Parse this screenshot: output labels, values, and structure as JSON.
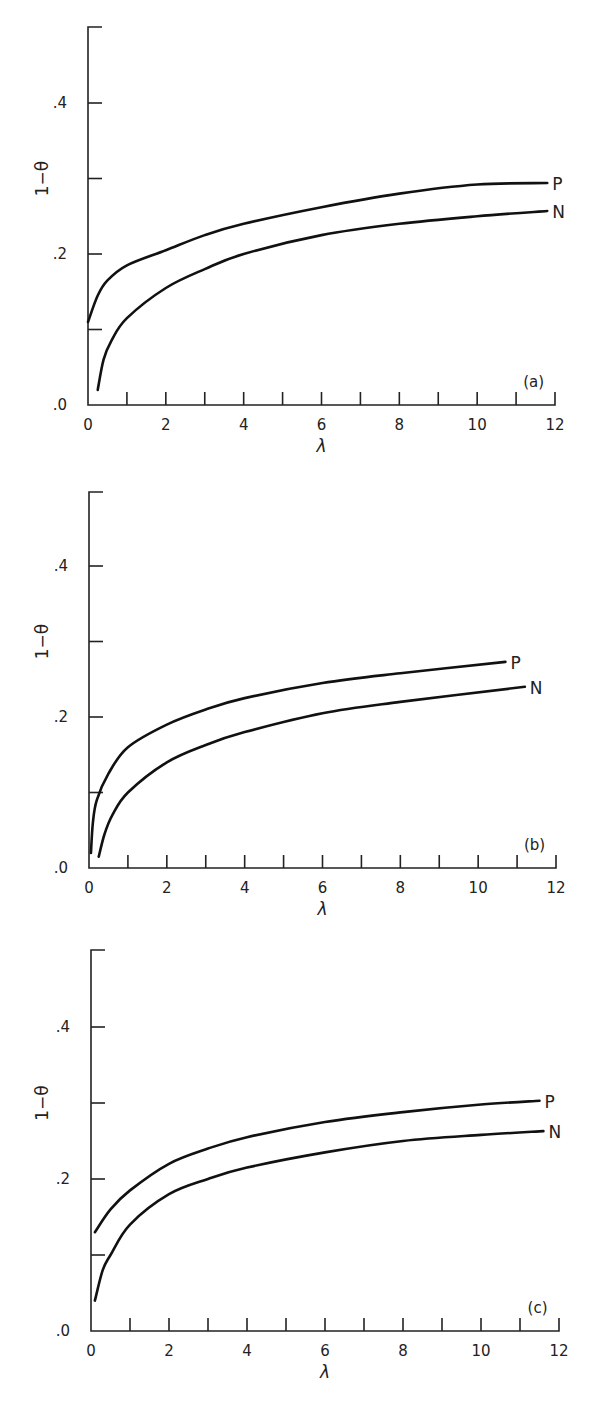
{
  "chart_data": [
    {
      "type": "line",
      "panel_label": "(a)",
      "xlabel": "λ",
      "ylabel": "1−θ",
      "xlim": [
        0,
        12
      ],
      "ylim": [
        0,
        0.5
      ],
      "xticks": [
        0,
        2,
        4,
        6,
        8,
        10,
        12
      ],
      "xtick_labels": [
        "0",
        "2",
        "4",
        "6",
        "8",
        "10",
        "12"
      ],
      "yticks": [
        0,
        0.1,
        0.2,
        0.3,
        0.4
      ],
      "ytick_labels": [
        ".0",
        "",
        ".2",
        "",
        ".4"
      ],
      "grid": false,
      "series": [
        {
          "name": "P",
          "x": [
            0,
            0.25,
            0.5,
            1,
            2,
            3,
            4,
            6,
            8,
            10,
            11.8
          ],
          "y": [
            0.11,
            0.145,
            0.165,
            0.185,
            0.205,
            0.225,
            0.24,
            0.262,
            0.28,
            0.292,
            0.294
          ]
        },
        {
          "name": "N",
          "x": [
            0.25,
            0.4,
            0.6,
            1,
            2,
            3,
            4,
            6,
            8,
            10,
            11.8
          ],
          "y": [
            0.02,
            0.06,
            0.085,
            0.115,
            0.155,
            0.18,
            0.2,
            0.225,
            0.24,
            0.25,
            0.257
          ]
        }
      ]
    },
    {
      "type": "line",
      "panel_label": "(b)",
      "xlabel": "λ",
      "ylabel": "1−θ",
      "xlim": [
        0,
        12
      ],
      "ylim": [
        0,
        0.5
      ],
      "xticks": [
        0,
        2,
        4,
        6,
        8,
        10,
        12
      ],
      "xtick_labels": [
        "0",
        "2",
        "4",
        "6",
        "8",
        "10",
        "12"
      ],
      "yticks": [
        0,
        0.1,
        0.2,
        0.3,
        0.4
      ],
      "ytick_labels": [
        ".0",
        "",
        ".2",
        "",
        ".4"
      ],
      "grid": false,
      "series": [
        {
          "name": "P",
          "x": [
            0.05,
            0.1,
            0.2,
            0.5,
            1,
            2,
            3,
            4,
            6,
            8,
            10.7
          ],
          "y": [
            0.02,
            0.06,
            0.09,
            0.125,
            0.16,
            0.19,
            0.21,
            0.225,
            0.245,
            0.258,
            0.273
          ]
        },
        {
          "name": "N",
          "x": [
            0.25,
            0.4,
            0.6,
            1,
            2,
            3,
            4,
            6,
            8,
            11.2
          ],
          "y": [
            0.015,
            0.045,
            0.07,
            0.1,
            0.14,
            0.163,
            0.18,
            0.205,
            0.22,
            0.24
          ]
        }
      ]
    },
    {
      "type": "line",
      "panel_label": "(c)",
      "xlabel": "λ",
      "ylabel": "1−θ",
      "xlim": [
        0,
        12
      ],
      "ylim": [
        0,
        0.5
      ],
      "xticks": [
        0,
        2,
        4,
        6,
        8,
        10,
        12
      ],
      "xtick_labels": [
        "0",
        "2",
        "4",
        "6",
        "8",
        "10",
        "12"
      ],
      "yticks": [
        0,
        0.1,
        0.2,
        0.3,
        0.4
      ],
      "ytick_labels": [
        ".0",
        "",
        ".2",
        "",
        ".4"
      ],
      "grid": false,
      "series": [
        {
          "name": "P",
          "x": [
            0.1,
            0.5,
            1,
            2,
            3,
            4,
            6,
            8,
            10,
            11.5
          ],
          "y": [
            0.13,
            0.16,
            0.185,
            0.22,
            0.24,
            0.255,
            0.275,
            0.288,
            0.298,
            0.303
          ]
        },
        {
          "name": "N",
          "x": [
            0.1,
            0.3,
            0.5,
            1,
            2,
            3,
            4,
            6,
            8,
            10,
            11.6
          ],
          "y": [
            0.04,
            0.08,
            0.1,
            0.14,
            0.18,
            0.2,
            0.215,
            0.235,
            0.25,
            0.258,
            0.263
          ]
        }
      ]
    }
  ],
  "panels": [
    {
      "id": "a",
      "label": "(a)",
      "top": 0,
      "origin_x": 88,
      "origin_y": 405,
      "x12": 555,
      "y_top": 27,
      "px_per_unit_y": 755
    },
    {
      "id": "b",
      "label": "(b)",
      "top": 0,
      "origin_x": 89,
      "origin_y": 868,
      "x12": 556,
      "y_top": 492,
      "px_per_unit_y": 755
    },
    {
      "id": "c",
      "label": "(c)",
      "top": 0,
      "origin_x": 91,
      "origin_y": 1331,
      "x12": 559,
      "y_top": 950,
      "px_per_unit_y": 760
    }
  ],
  "labels": {
    "series_p": "P",
    "series_n": "N",
    "xaxis": "λ",
    "yaxis": "1−θ"
  }
}
